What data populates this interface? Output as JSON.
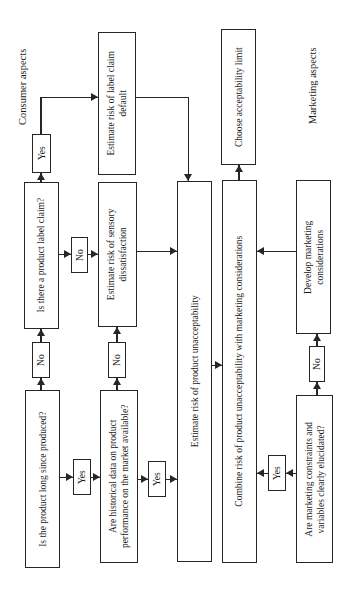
{
  "figure": {
    "bg": "#ffffff",
    "line_color": "#262626",
    "text_color": "#1a1a1a"
  },
  "section_labels": {
    "consumer": "Consumer aspects",
    "marketing": "Marketing aspects"
  },
  "nodes": {
    "q_produced": {
      "label": "Is the product long since produced?"
    },
    "yes_produced": {
      "label": "Yes"
    },
    "no_produced": {
      "label": "No"
    },
    "q_claim": {
      "label": "Is there a product label claim?"
    },
    "yes_claim": {
      "label": "Yes"
    },
    "no_claim": {
      "label": "No"
    },
    "est_label_default": {
      "label": [
        "Estimate risk of label claim",
        "default"
      ]
    },
    "est_sensory": {
      "label": [
        "Estimate risk of sensory",
        "dissatisfaction"
      ]
    },
    "q_historical": {
      "label": [
        "Are historical data on product",
        "performance on the market available?"
      ]
    },
    "yes_historical": {
      "label": "Yes"
    },
    "no_historical": {
      "label": "No"
    },
    "est_unacceptability": {
      "label": "Estimate risk of product unacceptability"
    },
    "combine": {
      "label": "Combine risk of product unacceptability with marketing considerations"
    },
    "choose": {
      "label": "Choose acceptability limit"
    },
    "q_marketing": {
      "label": [
        "Are marketing constraints and",
        "variables clearly elucidated?"
      ]
    },
    "yes_marketing": {
      "label": "Yes"
    },
    "no_marketing": {
      "label": "No"
    },
    "develop": {
      "label": [
        "Develop marketing",
        "considerations"
      ]
    }
  }
}
